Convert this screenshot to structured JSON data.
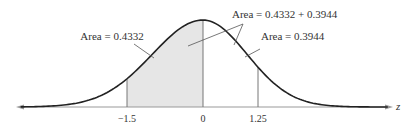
{
  "chart_data": {
    "type": "area",
    "title": "",
    "xlabel": "z",
    "ylabel": "",
    "distribution": "standard normal",
    "tick_labels": [
      "-1.5",
      "0",
      "1.25"
    ],
    "ticks": [
      -1.5,
      0,
      1.25
    ],
    "shaded_region": {
      "from": -1.5,
      "to": 0,
      "fill": "#e6e6e6"
    },
    "annotations": [
      {
        "text": "Area = 0.4332",
        "region": [
          -1.5,
          0
        ],
        "value": 0.4332
      },
      {
        "text": "Area = 0.4332 + 0.3944",
        "region": [
          -1.5,
          1.25
        ],
        "value": 0.8276
      },
      {
        "text": "Area = 0.3944",
        "region": [
          0,
          1.25
        ],
        "value": 0.3944
      }
    ],
    "grid": false,
    "legend": null
  },
  "labels": {
    "area_left": "Area = 0.4332",
    "area_sum": "Area = 0.4332 + 0.3944",
    "area_right": "Area = 0.3944",
    "tick_neg": "−1.5",
    "tick_zero": "0",
    "tick_pos": "1.25",
    "axis_var": "z"
  },
  "colors": {
    "curve": "#222222",
    "shade": "#e6e6e6",
    "axis": "#999999",
    "leader": "#555555"
  }
}
